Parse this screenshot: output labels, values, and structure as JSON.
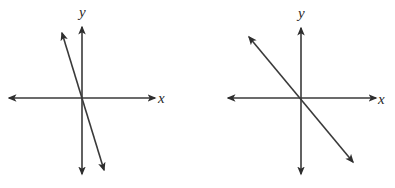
{
  "colors": {
    "stroke": "#3a3a3a",
    "background": "#ffffff"
  },
  "graphs": [
    {
      "id": "left",
      "x_label": "x",
      "y_label": "y",
      "origin": [
        82,
        98
      ],
      "x_axis": {
        "from": [
          9,
          98
        ],
        "to": [
          155,
          98
        ]
      },
      "y_axis": {
        "from": [
          82,
          174
        ],
        "to": [
          82,
          27
        ]
      },
      "line": {
        "from": [
          62,
          33
        ],
        "to": [
          104,
          170
        ],
        "description": "steep line with negative slope through origin"
      }
    },
    {
      "id": "right",
      "x_label": "x",
      "y_label": "y",
      "origin": [
        301,
        98
      ],
      "x_axis": {
        "from": [
          228,
          98
        ],
        "to": [
          376,
          98
        ]
      },
      "y_axis": {
        "from": [
          301,
          174
        ],
        "to": [
          301,
          28
        ]
      },
      "line": {
        "from": [
          249,
          37
        ],
        "to": [
          353,
          162
        ],
        "description": "line with negative slope (about -1) through origin"
      }
    }
  ]
}
